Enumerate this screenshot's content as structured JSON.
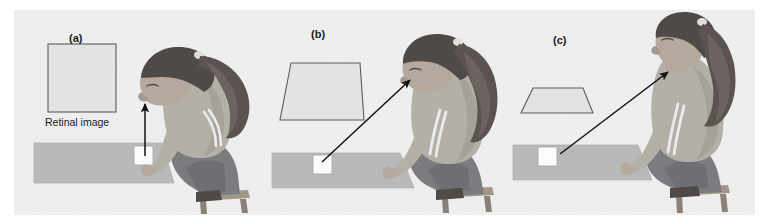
{
  "figure": {
    "background_color": "#ffffff",
    "panel_background_color": "#efeff0",
    "panel_rect": {
      "x": 14,
      "y": 10,
      "width": 741,
      "height": 205
    }
  },
  "palette": {
    "panel_bg": "#efeff0",
    "table_fill": "#b9b9b9",
    "table_stroke": "#a9a9a9",
    "retinal_fill": "#e3e3e4",
    "retinal_stroke": "#5c5c5c",
    "white_square": "#fbfbfb",
    "white_square_stroke": "#9a9a9a",
    "hair_dark": "#4f4a48",
    "hair_mid": "#6a635f",
    "skin": "#b5a89c",
    "skin_shadow": "#9b8e84",
    "shirt": "#b3b0a8",
    "shirt_shadow": "#a29e96",
    "pants": "#7c7c80",
    "pants_shadow": "#6c6c70",
    "stool": "#a0968a",
    "stool_shadow": "#8a8076",
    "stripe": "#ececec",
    "arrow": "#121212"
  },
  "panels": [
    {
      "id": "a",
      "letter": "(a)",
      "retinal_shape": "square",
      "retinal_shape_description": "Square retinal image — observer views tabletop square from directly above",
      "caption": "Retinal image",
      "arrow": {
        "description": "vertical arrow from white square up to eye",
        "from": [
          145,
          155
        ],
        "to": [
          145,
          101
        ]
      },
      "posture": "head bent far down, looking straight down at the square"
    },
    {
      "id": "b",
      "letter": "(b)",
      "retinal_shape": "trapezoid-tall",
      "retinal_shape_description": "Tall trapezoid retinal image — observer views tabletop square from an intermediate angle",
      "caption": "",
      "arrow": {
        "description": "diagonal arrow from white square up-right to eye",
        "from": [
          322,
          160
        ],
        "to": [
          407,
          79
        ]
      },
      "posture": "head bent forward at a moderate angle"
    },
    {
      "id": "c",
      "letter": "(c)",
      "retinal_shape": "trapezoid-flat",
      "retinal_shape_description": "Flat wide trapezoid retinal image — observer views tabletop square from a shallow grazing angle",
      "caption": "",
      "arrow": {
        "description": "long shallow diagonal arrow from white square up-right to eye",
        "from": [
          560,
          152
        ],
        "to": [
          665,
          71
        ]
      },
      "posture": "head upright, looking nearly horizontally across the table"
    }
  ],
  "scene": {
    "table_label": "tabletop surface",
    "square_label": "white square target on tabletop",
    "person_label": "seated observer on stool"
  }
}
